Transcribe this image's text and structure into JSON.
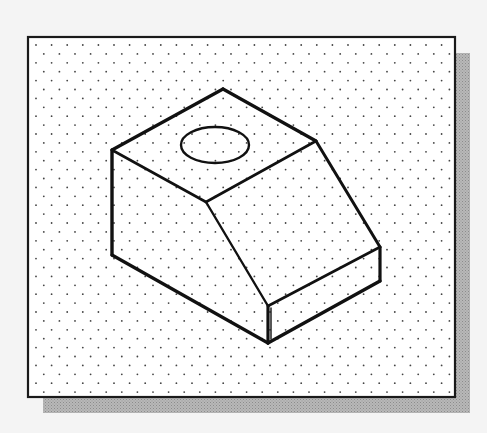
{
  "figure": {
    "title": "Isometric sketch of a block with a sloped face and a circular hole on top, drawn on an isometric dot grid",
    "background_color": "#f4f4f4",
    "frame": {
      "x": 28,
      "y": 37,
      "width": 427,
      "height": 360,
      "stroke": "#1a1a1a",
      "fill": "#ffffff"
    },
    "shadow": {
      "offset_x": 15,
      "offset_y": 16,
      "color": "#a8a8a8"
    },
    "grid": {
      "spacing_x": 15.6,
      "spacing_y": 8.9,
      "dot_color": "#444444",
      "dot_radius": 0.9
    },
    "object": {
      "stroke": "#111111",
      "vertices": {
        "top_apex": [
          223,
          89
        ],
        "left_top": [
          112,
          150
        ],
        "ridge_right": [
          316,
          141
        ],
        "ridge_mid": [
          206,
          202
        ],
        "left_bottom": [
          112,
          255
        ],
        "slope_bottom_right": [
          380,
          247
        ],
        "right_bottom": [
          380,
          281
        ],
        "step_top_front": [
          268,
          306
        ],
        "front_bottom": [
          268,
          343
        ]
      },
      "hole": {
        "cx": 215,
        "cy": 145,
        "rx": 34,
        "ry": 18
      }
    }
  }
}
